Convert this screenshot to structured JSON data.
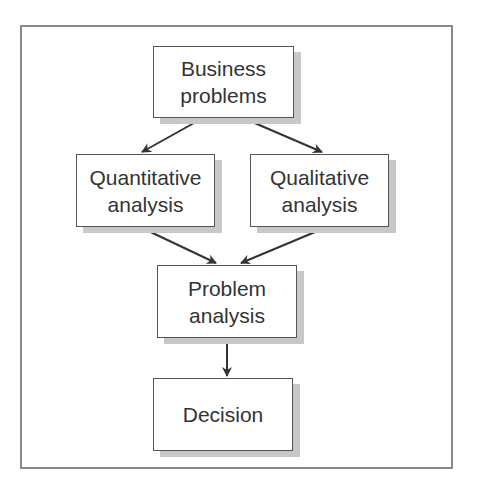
{
  "diagram": {
    "nodes": [
      {
        "id": "business",
        "lines": [
          "Business",
          "problems"
        ]
      },
      {
        "id": "quant",
        "lines": [
          "Quantitative",
          "analysis"
        ]
      },
      {
        "id": "qual",
        "lines": [
          "Qualitative",
          "analysis"
        ]
      },
      {
        "id": "problem",
        "lines": [
          "Problem",
          "analysis"
        ]
      },
      {
        "id": "decision",
        "lines": [
          "Decision"
        ]
      }
    ],
    "edges": [
      {
        "from": "business",
        "to": "quant"
      },
      {
        "from": "business",
        "to": "qual"
      },
      {
        "from": "quant",
        "to": "problem"
      },
      {
        "from": "qual",
        "to": "problem"
      },
      {
        "from": "problem",
        "to": "decision"
      }
    ],
    "colors": {
      "border": "#555555",
      "shadow": "#c8c8c8",
      "frame": "#8a8a8a",
      "text": "#333333"
    }
  }
}
